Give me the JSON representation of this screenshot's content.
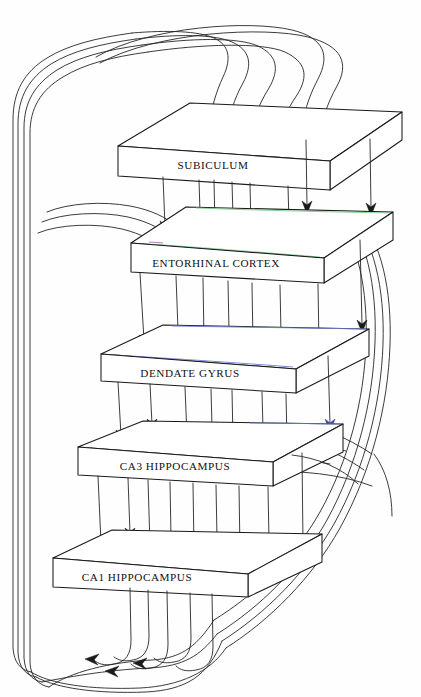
{
  "figure": {
    "style": "hand-drawn pen sketch, five stacked 3D slabs with projection arrows and recurrent feedback loops",
    "background_color": "#fefefe",
    "ink_color": "#1a1a1a"
  },
  "slabs": [
    {
      "id": "subiculum",
      "label": "SUBICULUM",
      "order": 1,
      "label_x": 213,
      "label_y": 160,
      "top": [
        [
          190,
          103
        ],
        [
          402,
          112
        ],
        [
          330,
          161
        ],
        [
          118,
          146
        ]
      ],
      "front": [
        [
          118,
          146
        ],
        [
          330,
          161
        ],
        [
          330,
          190
        ],
        [
          118,
          176
        ]
      ],
      "side": [
        [
          330,
          161
        ],
        [
          402,
          112
        ],
        [
          402,
          140
        ],
        [
          330,
          190
        ]
      ],
      "tint": "none"
    },
    {
      "id": "entorhinal-cortex",
      "label": "ENTORHINAL CORTEX",
      "order": 2,
      "label_x": 216,
      "label_y": 263,
      "top": [
        [
          186,
          207
        ],
        [
          393,
          212
        ],
        [
          324,
          258
        ],
        [
          131,
          243
        ]
      ],
      "front": [
        [
          131,
          243
        ],
        [
          324,
          258
        ],
        [
          324,
          283
        ],
        [
          131,
          272
        ]
      ],
      "side": [
        [
          324,
          258
        ],
        [
          393,
          212
        ],
        [
          393,
          240
        ],
        [
          324,
          283
        ]
      ],
      "tint": "green"
    },
    {
      "id": "dendate-gyrus",
      "label": "DENDATE GYRUS",
      "order": 3,
      "label_x": 190,
      "label_y": 373,
      "top": [
        [
          163,
          325
        ],
        [
          369,
          329
        ],
        [
          296,
          369
        ],
        [
          101,
          354
        ]
      ],
      "front": [
        [
          101,
          354
        ],
        [
          296,
          369
        ],
        [
          296,
          393
        ],
        [
          101,
          381
        ]
      ],
      "side": [
        [
          296,
          369
        ],
        [
          369,
          329
        ],
        [
          369,
          356
        ],
        [
          296,
          393
        ]
      ],
      "tint": "blue"
    },
    {
      "id": "ca3-hippocampus",
      "label": "CA3 HIPPOCAMPUS",
      "order": 4,
      "label_x": 175,
      "label_y": 466,
      "top": [
        [
          143,
          421
        ],
        [
          343,
          424
        ],
        [
          273,
          462
        ],
        [
          78,
          447
        ]
      ],
      "front": [
        [
          78,
          447
        ],
        [
          273,
          462
        ],
        [
          273,
          486
        ],
        [
          78,
          475
        ]
      ],
      "side": [
        [
          273,
          462
        ],
        [
          343,
          424
        ],
        [
          343,
          452
        ],
        [
          273,
          486
        ]
      ],
      "tint": "blue"
    },
    {
      "id": "ca1-hippocampus",
      "label": "CA1 HIPPOCAMPUS",
      "order": 5,
      "label_x": 137,
      "label_y": 577,
      "top": [
        [
          112,
          530
        ],
        [
          322,
          534
        ],
        [
          248,
          574
        ],
        [
          53,
          558
        ]
      ],
      "front": [
        [
          53,
          558
        ],
        [
          248,
          574
        ],
        [
          248,
          597
        ],
        [
          53,
          587
        ]
      ],
      "side": [
        [
          248,
          574
        ],
        [
          322,
          534
        ],
        [
          322,
          562
        ],
        [
          248,
          597
        ]
      ],
      "tint": "none"
    }
  ],
  "connections": [
    {
      "from": "feedback-loop-top",
      "to": "subiculum",
      "arrows": 6,
      "kind": "incoming-curved-top"
    },
    {
      "from": "subiculum",
      "to": "entorhinal-cortex",
      "arrows": 7,
      "kind": "vertical-down"
    },
    {
      "from": "feedback-loop-left",
      "to": "entorhinal-cortex",
      "arrows": 3,
      "kind": "incoming-curved-left"
    },
    {
      "from": "entorhinal-cortex",
      "to": "dendate-gyrus",
      "arrows": 7,
      "kind": "vertical-down"
    },
    {
      "from": "dendate-gyrus",
      "to": "ca3-hippocampus",
      "arrows": 8,
      "kind": "vertical-down"
    },
    {
      "from": "feedback-loop-right",
      "to": "ca3-hippocampus",
      "arrows": 2,
      "kind": "incoming-curved-right"
    },
    {
      "from": "ca3-hippocampus",
      "to": "ca1-hippocampus",
      "arrows": 9,
      "kind": "vertical-down"
    },
    {
      "from": "ca1-hippocampus",
      "to": "feedback-loop-bottom",
      "arrows": 3,
      "kind": "outgoing-down-curved"
    }
  ],
  "loops": {
    "left_rail_count": 4,
    "right_rail_count": 3,
    "bottom_arrowheads": 3,
    "top_arrowheads": 6
  }
}
